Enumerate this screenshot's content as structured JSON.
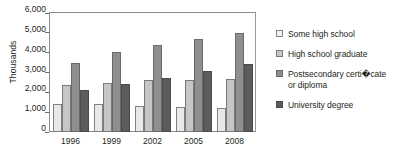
{
  "chart_data": {
    "type": "bar",
    "title": "",
    "xlabel": "",
    "ylabel": "Thousands",
    "ylim": [
      0,
      6000
    ],
    "ytick_step": 1000,
    "ytick_labels": [
      "6,000",
      "5,000",
      "4,000",
      "3,000",
      "2,000",
      "1,000",
      "0"
    ],
    "ytick_values": [
      6000,
      5000,
      4000,
      3000,
      2000,
      1000,
      0
    ],
    "grid": false,
    "legend_position": "right",
    "categories": [
      "1996",
      "1999",
      "2002",
      "2005",
      "2008"
    ],
    "series": [
      {
        "name": "Some high school",
        "color": "#e8e8e8",
        "values": [
          1400,
          1390,
          1300,
          1240,
          1190
        ]
      },
      {
        "name": "High school graduate",
        "color": "#c6c6c6",
        "values": [
          2380,
          2450,
          2620,
          2640,
          2690
        ]
      },
      {
        "name": "Postsecondary certificate or diploma",
        "color": "#8f8f8f",
        "values": [
          3500,
          4010,
          4380,
          4700,
          5000
        ]
      },
      {
        "name": "University degree",
        "color": "#5c5c5c",
        "values": [
          2120,
          2400,
          2700,
          3080,
          3450
        ]
      }
    ]
  },
  "legend": {
    "items": [
      {
        "label": "Some high school",
        "pre": "Some high school",
        "lig": "",
        "post": "",
        "line2": ""
      },
      {
        "label": "High school graduate",
        "pre": "High school graduate",
        "lig": "",
        "post": "",
        "line2": ""
      },
      {
        "label": "Postsecondary certificate or diploma",
        "pre": "Postsecondary certi",
        "lig": "�",
        "post": "cate",
        "line2": "or diploma"
      },
      {
        "label": "University degree",
        "pre": "University degree",
        "lig": "",
        "post": "",
        "line2": ""
      }
    ]
  },
  "axis": {
    "y_title": "Thousands"
  }
}
